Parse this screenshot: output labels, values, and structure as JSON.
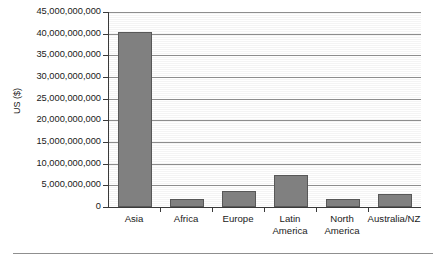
{
  "chart_data": {
    "type": "bar",
    "title": "",
    "subtitle": "",
    "xlabel": "",
    "ylabel": "US ($)",
    "categories": [
      "Asia",
      "Africa",
      "Europe",
      "Latin America",
      "North America",
      "Australia/NZ"
    ],
    "category_lines": [
      [
        "Asia"
      ],
      [
        "Africa"
      ],
      [
        "Europe"
      ],
      [
        "Latin",
        "America"
      ],
      [
        "North",
        "America"
      ],
      [
        "Australia/NZ"
      ]
    ],
    "values": [
      40500000000,
      1800000000,
      3700000000,
      7500000000,
      1900000000,
      2900000000
    ],
    "series": [
      {
        "name": "US ($)",
        "values": [
          40500000000,
          1800000000,
          3700000000,
          7500000000,
          1900000000,
          2900000000
        ]
      }
    ],
    "ylim": [
      0,
      45000000000
    ],
    "ytick_values": [
      0,
      5000000000,
      10000000000,
      15000000000,
      20000000000,
      25000000000,
      30000000000,
      35000000000,
      40000000000,
      45000000000
    ],
    "ytick_labels": [
      "0",
      "5,000,000,000",
      "10,000,000,000",
      "15,000,000,000",
      "20,000,000,000",
      "25,000,000,000",
      "30,000,000,000",
      "35,000,000,000",
      "40,000,000,000",
      "45,000,000,000"
    ],
    "grid": true,
    "grid_axis": "y",
    "legend": false,
    "legend_position": "none",
    "bar_color": "#808080",
    "bar_border_color": "#585858",
    "gridline_color": "#8d8d8d",
    "axis_color": "#3a3a3a",
    "plot_background": "#ffffff",
    "annotations": []
  }
}
